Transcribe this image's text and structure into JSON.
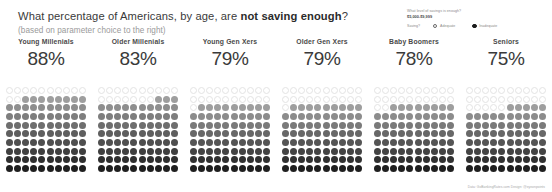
{
  "header": {
    "title_part1": "What percentage of Americans, by age, are ",
    "title_emphasis": "not saving enough",
    "title_part3": "?",
    "subtitle": "(based on parameter choice to the right)"
  },
  "parameters": {
    "question": "What level of savings is enough?",
    "value": "$5,000-$9,999",
    "group_label": "Saving?",
    "options": [
      {
        "label": "Adequate",
        "selected": false
      },
      {
        "label": "Inadequate",
        "selected": true
      }
    ]
  },
  "footer": {
    "credit": "Data: GoBankingRates.com  Design: @eyeonpoints"
  },
  "chart_data": {
    "type": "waffle",
    "title": "What percentage of Americans, by age, are not saving enough?",
    "subtitle": "(based on parameter choice to the right)",
    "unit": "%",
    "grid_rows": 10,
    "grid_cols": 10,
    "total_dots": 100,
    "fill_direction": "bottom-up",
    "categories": [
      "Young Millenials",
      "Older Millenials",
      "Young Gen Xers",
      "Older Gen Xers",
      "Baby Boomers",
      "Seniors"
    ],
    "values": [
      88,
      83,
      79,
      79,
      78,
      75
    ],
    "value_labels": [
      "88%",
      "83%",
      "79%",
      "79%",
      "78%",
      "75%"
    ],
    "ylabel": "",
    "xlabel": "",
    "ylim": [
      0,
      100
    ],
    "grid": false,
    "legend": "none",
    "gradient": {
      "description": "Filled dots shade from light gray at the top of the fill to near-black at the bottom row.",
      "light": "#9e9e9e",
      "dark": "#1f1f1f",
      "empty_fill": "#ffffff",
      "empty_stroke": "#e3e3e3"
    }
  }
}
